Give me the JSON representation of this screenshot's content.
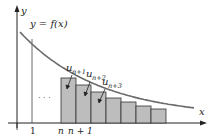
{
  "diagram": {
    "type": "integral-test-rectangles",
    "colors": {
      "axis": "#222222",
      "curve": "#6b6b6b",
      "rect_fill": "#bdbdbd",
      "rect_stroke": "#333333",
      "guide_line": "#444444"
    },
    "labels": {
      "y_axis": "y",
      "x_axis": "x",
      "curve": "y = f(x)",
      "ellipsis": "· · ·",
      "tick_1": "1",
      "tick_n": "n",
      "tick_n1": "n + 1"
    },
    "term_labels": [
      {
        "base": "u",
        "sub": "n+1"
      },
      {
        "base": "u",
        "sub": "n+2"
      },
      {
        "base": "u",
        "sub": "n+3"
      }
    ],
    "rectangle_heights": [
      0.45,
      0.38,
      0.31,
      0.25,
      0.21,
      0.17,
      0.14
    ],
    "rectangle_count": 7
  }
}
